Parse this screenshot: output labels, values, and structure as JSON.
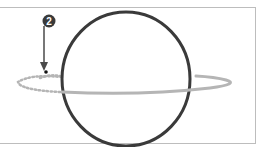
{
  "callout": {
    "number": "2"
  },
  "colors": {
    "circle_stroke": "#3a3a3a",
    "ring_stroke": "#b5b5b5",
    "arrow": "#4a4a4a",
    "badge_fill": "#3a3a3a",
    "frame_border": "#bdbdbd"
  }
}
